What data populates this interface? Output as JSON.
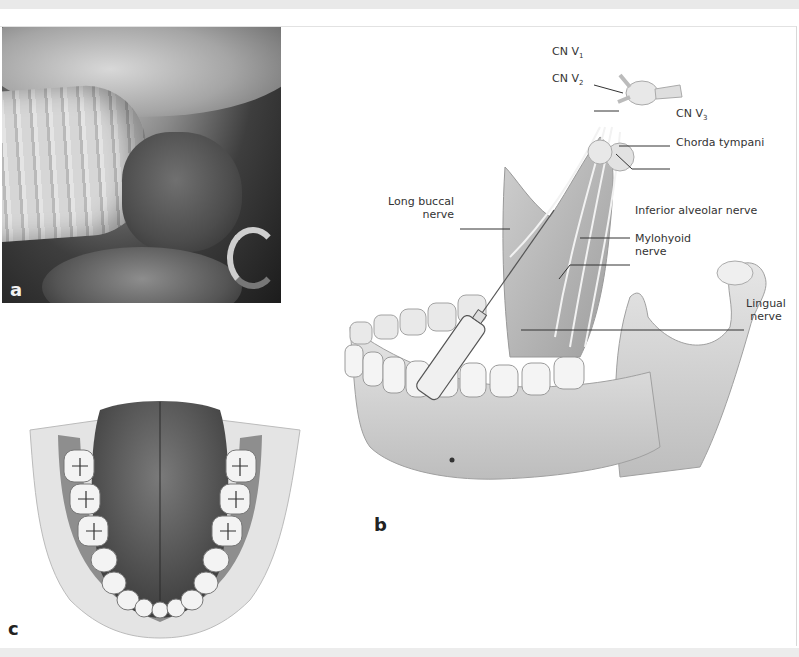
{
  "figure": {
    "panels": [
      {
        "id": "a",
        "label": "a",
        "type": "clinical-photo",
        "description": "intraoral photograph with tube and tongue"
      },
      {
        "id": "b",
        "label": "b",
        "type": "anatomical-illustration",
        "description": "mandible with syringe and nerves"
      },
      {
        "id": "c",
        "label": "c",
        "type": "anatomical-illustration",
        "description": "tongue and lower dental arch, superior view"
      }
    ],
    "callouts": {
      "cn_v1": {
        "text": "CN V",
        "sub": "1"
      },
      "cn_v2": {
        "text": "CN V",
        "sub": "2"
      },
      "cn_v3": {
        "text": "CN V",
        "sub": "3"
      },
      "chorda_tympani": "Chorda tympani",
      "long_buccal_line1": "Long buccal",
      "long_buccal_line2": "nerve",
      "inferior_alveolar": "Inferior alveolar nerve",
      "mylohyoid_line1": "Mylohyoid",
      "mylohyoid_line2": "nerve",
      "lingual_line1": "Lingual",
      "lingual_line2": "nerve"
    }
  }
}
